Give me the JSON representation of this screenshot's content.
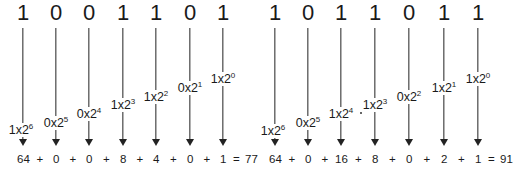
{
  "left": {
    "bits": [
      "1",
      "0",
      "0",
      "1",
      "1",
      "0",
      "1"
    ],
    "x": [
      23,
      56,
      89,
      123,
      156,
      190,
      223
    ],
    "labels": [
      {
        "coef": "1",
        "exp": "6",
        "y": 123
      },
      {
        "coef": "0",
        "exp": "5",
        "y": 116
      },
      {
        "coef": "0",
        "exp": "4",
        "y": 107
      },
      {
        "coef": "1",
        "exp": "3",
        "y": 98
      },
      {
        "coef": "1",
        "exp": "2",
        "y": 90
      },
      {
        "coef": "0",
        "exp": "1",
        "y": 81
      },
      {
        "coef": "1",
        "exp": "0",
        "y": 72
      }
    ],
    "terms": [
      "64",
      "0",
      "0",
      "8",
      "4",
      "0",
      "1"
    ],
    "result": "77"
  },
  "right": {
    "bits": [
      "1",
      "0",
      "1",
      "1",
      "0",
      "1",
      "1"
    ],
    "x": [
      275,
      308,
      341,
      375,
      409,
      444,
      478
    ],
    "labels": [
      {
        "coef": "1",
        "exp": "6",
        "y": 124
      },
      {
        "coef": "0",
        "exp": "5",
        "y": 116
      },
      {
        "coef": "1",
        "exp": "4",
        "y": 107
      },
      {
        "coef": "1",
        "exp": "3",
        "y": 98
      },
      {
        "coef": "0",
        "exp": "2",
        "y": 90
      },
      {
        "coef": "1",
        "exp": "1",
        "y": 81
      },
      {
        "coef": "1",
        "exp": "0",
        "y": 72
      }
    ],
    "terms": [
      "64",
      "0",
      "16",
      "8",
      "0",
      "2",
      "1"
    ],
    "result": "91"
  },
  "symbols": {
    "plus": "+",
    "equals": "=",
    "times": "x",
    "base": "2"
  }
}
